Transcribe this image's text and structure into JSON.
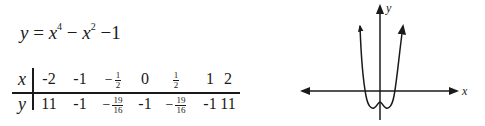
{
  "equation": {
    "lhs": "y",
    "equals": "=",
    "term1_base": "x",
    "term1_exp": "4",
    "minus1": "−",
    "term2_base": "x",
    "term2_exp": "2",
    "minus2": "−1"
  },
  "table": {
    "x_header": "x",
    "y_header": "y",
    "x_values": [
      {
        "text": "-2"
      },
      {
        "text": "-1"
      },
      {
        "neg": "−",
        "num": "1",
        "den": "2"
      },
      {
        "text": "0"
      },
      {
        "num": "1",
        "den": "2"
      },
      {
        "text": "1"
      },
      {
        "text": "2"
      }
    ],
    "y_values": [
      {
        "text": "11"
      },
      {
        "text": "-1"
      },
      {
        "neg": "−",
        "num": "19",
        "den": "16"
      },
      {
        "text": "-1"
      },
      {
        "neg": "−",
        "num": "19",
        "den": "16"
      },
      {
        "text": "-1"
      },
      {
        "text": "11"
      }
    ]
  },
  "graph": {
    "x_axis_label": "x",
    "y_axis_label": "y",
    "function": "y = x^4 - x^2 - 1",
    "line_color": "#1a1a1a"
  }
}
